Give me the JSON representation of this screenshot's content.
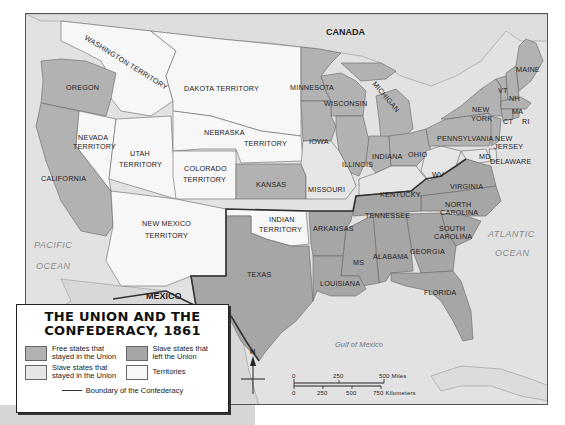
{
  "title": "THE UNION AND THE CONFEDERACY, 1861",
  "legend": {
    "title_line1": "THE UNION AND THE",
    "title_line2": "CONFEDERACY, 1861",
    "items": [
      {
        "label": "Free states that stayed in the Union",
        "color": "#b2b2b2"
      },
      {
        "label": "Slave states that left the Union",
        "color": "#a6a6a6"
      },
      {
        "label": "Slave states that stayed in the Union",
        "color": "#e6e6e6"
      },
      {
        "label": "Territories",
        "color": "#f7f7f7"
      }
    ],
    "boundary_label": "Boundary of the Confederacy"
  },
  "colors": {
    "free": "#b2b2b2",
    "confederate": "#a6a6a6",
    "border_slave": "#e6e6e6",
    "territory": "#f7f7f7",
    "water": "#e2e2e2",
    "foreign": "#d9d9d9",
    "boundary": "#333333"
  },
  "labels": {
    "canada": "CANADA",
    "mexico": "MEXICO",
    "pacific_1": "PACIFIC",
    "pacific_2": "OCEAN",
    "atlantic_1": "ATLANTIC",
    "atlantic_2": "OCEAN",
    "gulf": "Gulf of Mexico",
    "washington": "WASHINGTON TERRITORY",
    "oregon": "OREGON",
    "california": "CALIFORNIA",
    "nevada_1": "NEVADA",
    "nevada_2": "TERRITORY",
    "utah_1": "UTAH",
    "utah_2": "TERRITORY",
    "dakota": "DAKOTA TERRITORY",
    "nebraska_1": "NEBRASKA",
    "nebraska_2": "TERRITORY",
    "colorado_1": "COLORADO",
    "colorado_2": "TERRITORY",
    "newmexico_1": "NEW MEXICO",
    "newmexico_2": "TERRITORY",
    "kansas": "KANSAS",
    "indian_1": "INDIAN",
    "indian_2": "TERRITORY",
    "texas": "TEXAS",
    "minnesota": "MINNESOTA",
    "wisconsin": "WISCONSIN",
    "michigan": "MICHIGAN",
    "iowa": "IOWA",
    "illinois": "ILLINOIS",
    "indiana": "INDIANA",
    "ohio": "OHIO",
    "missouri": "MISSOURI",
    "kentucky": "KENTUCKY",
    "arkansas": "ARKANSAS",
    "louisiana": "LOUISIANA",
    "ms": "MS",
    "alabama": "ALABAMA",
    "georgia": "GEORGIA",
    "florida": "FLORIDA",
    "tennessee": "TENNESSEE",
    "nc_1": "NORTH",
    "nc_2": "CAROLINA",
    "sc_1": "SOUTH",
    "sc_2": "CAROLINA",
    "virginia": "VIRGINIA",
    "wv": "WV",
    "md": "MD",
    "delaware": "DELAWARE",
    "pennsylvania": "PENNSYLVANIA",
    "nj_1": "NEW",
    "nj_2": "JERSEY",
    "ny_1": "NEW",
    "ny_2": "YORK",
    "vt": "VT",
    "nh": "NH",
    "ma": "MA",
    "ct": "CT",
    "ri": "RI",
    "maine": "MAINE"
  },
  "compass": {
    "north": "N"
  },
  "scale": {
    "miles_ticks": [
      "0",
      "250",
      "500 Miles"
    ],
    "km_ticks": [
      "0",
      "250",
      "500",
      "750 Kilometers"
    ]
  }
}
